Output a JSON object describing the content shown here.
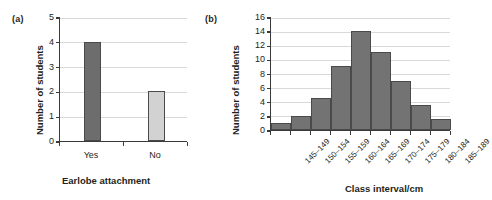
{
  "figure": {
    "panels": [
      {
        "tag": "(a)",
        "ylabel": "Number of students",
        "xlabel": "Earlobe attachment"
      },
      {
        "tag": "(b)",
        "ylabel": "Number of students",
        "xlabel": "Class interval/cm"
      }
    ]
  },
  "chart_data": [
    {
      "type": "bar",
      "panel": "(a)",
      "title": "",
      "xlabel": "Earlobe attachment",
      "ylabel": "Number of students",
      "categories": [
        "Yes",
        "No"
      ],
      "values": [
        4,
        2
      ],
      "ytick_labels": [
        "0",
        "1",
        "2",
        "3",
        "4",
        "5"
      ],
      "ytick_values": [
        0,
        1,
        2,
        3,
        4,
        5
      ],
      "ylim": [
        0,
        5
      ],
      "grid": true,
      "legend": "none",
      "bar_colors": [
        "#6d6d6d",
        "#d2d2d2"
      ],
      "bar_edge_color": "#4a4a4a"
    },
    {
      "type": "bar",
      "panel": "(b)",
      "title": "",
      "xlabel": "Class interval/cm",
      "ylabel": "Number of students",
      "categories": [
        "145–149",
        "150–154",
        "155–159",
        "160–164",
        "165–169",
        "170–174",
        "175–179",
        "180–184",
        "185–189"
      ],
      "values": [
        1,
        2,
        4.5,
        9,
        14,
        11,
        7,
        3.5,
        1.5
      ],
      "ytick_labels": [
        "0",
        "2",
        "4",
        "6",
        "8",
        "10",
        "12",
        "14",
        "16"
      ],
      "ytick_values": [
        0,
        2,
        4,
        6,
        8,
        10,
        12,
        14,
        16
      ],
      "ylim": [
        0,
        16
      ],
      "grid": true,
      "legend": "none",
      "bar_colors": [
        "#737373"
      ],
      "bar_edge_color": "#4a4a4a"
    }
  ]
}
